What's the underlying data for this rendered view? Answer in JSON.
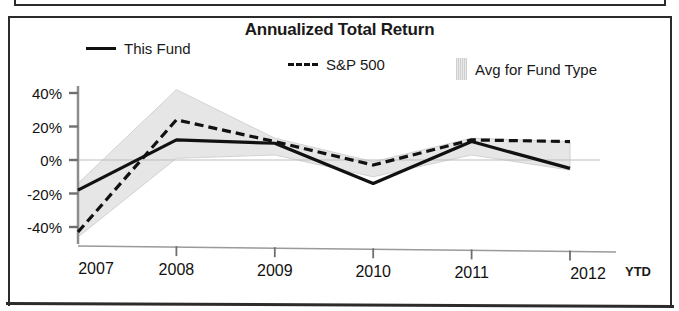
{
  "chart_data": {
    "type": "line",
    "title": "Annualized Total Return",
    "xlabel": "",
    "ylabel": "",
    "categories": [
      "2007",
      "2008",
      "2009",
      "2010",
      "2011",
      "2012"
    ],
    "x_axis_note": "YTD",
    "ylim": [
      -40,
      40
    ],
    "ytick_labels": [
      "40%",
      "20%",
      "0%",
      "-20%",
      "-40%"
    ],
    "ytick_values": [
      40,
      20,
      0,
      -20,
      -40
    ],
    "grid": false,
    "legend_position": "top",
    "series": [
      {
        "name": "This Fund",
        "style": "solid",
        "color": "#111111",
        "values": [
          -18,
          12,
          10,
          -14,
          11,
          -5
        ]
      },
      {
        "name": "S&P 500",
        "style": "dashed",
        "color": "#111111",
        "values": [
          -43,
          24,
          11,
          -3,
          12,
          11
        ]
      },
      {
        "name": "Avg for Fund Type",
        "style": "band",
        "color": "#e2e2e2",
        "upper": [
          -14,
          42,
          13,
          -1,
          13,
          11
        ],
        "lower": [
          -46,
          1,
          3,
          -10,
          3,
          -6
        ]
      }
    ]
  },
  "legend": {
    "this_fund": "This Fund",
    "sp500": "S&P 500",
    "avg_fund_type": "Avg for Fund Type"
  },
  "axis": {
    "y_labels": [
      "40%",
      "20%",
      "0%",
      "-20%",
      "-40%"
    ],
    "x_labels": [
      "2007",
      "2008",
      "2009",
      "2010",
      "2011",
      "2012"
    ],
    "ytd": "YTD"
  },
  "colors": {
    "line": "#111111",
    "band": "#e2e2e2",
    "frame": "#2b2b2b",
    "background": "#ffffff"
  }
}
